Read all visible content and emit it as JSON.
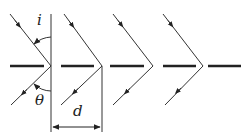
{
  "diagram": {
    "labels": {
      "incidence_angle": "i",
      "reflection_angle": "θ",
      "spacing": "d"
    },
    "elements": {
      "slit_count": 5,
      "ray_pairs": 4
    },
    "colors": {
      "line": "#333333",
      "bar": "#222222"
    }
  }
}
